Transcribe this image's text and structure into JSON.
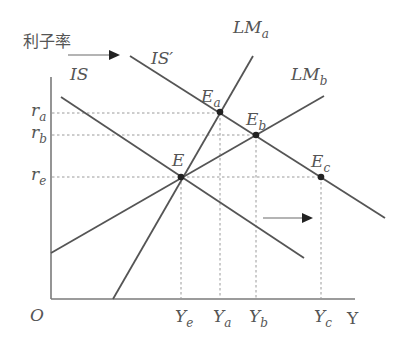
{
  "diagram": {
    "type": "IS-LM",
    "y_axis_label": "利子率",
    "x_axis_label": "Y",
    "origin_label": "O",
    "curves": {
      "IS": {
        "label": "IS",
        "sub": ""
      },
      "IS_prime": {
        "label": "IS′",
        "sub": ""
      },
      "LM_a": {
        "label": "LM",
        "sub": "a"
      },
      "LM_b": {
        "label": "LM",
        "sub": "b"
      }
    },
    "points": {
      "E": {
        "label": "E",
        "sub": ""
      },
      "E_a": {
        "label": "E",
        "sub": "a"
      },
      "E_b": {
        "label": "E",
        "sub": "b"
      },
      "E_c": {
        "label": "E",
        "sub": "c"
      }
    },
    "interest_rates": [
      {
        "label": "r",
        "sub": "a"
      },
      {
        "label": "r",
        "sub": "b"
      },
      {
        "label": "r",
        "sub": "e"
      }
    ],
    "incomes": [
      {
        "label": "Y",
        "sub": "e"
      },
      {
        "label": "Y",
        "sub": "a"
      },
      {
        "label": "Y",
        "sub": "b"
      },
      {
        "label": "Y",
        "sub": "c"
      }
    ],
    "shift_arrows": [
      "IS → IS′ (top)",
      "IS → IS′ (bottom)"
    ]
  }
}
